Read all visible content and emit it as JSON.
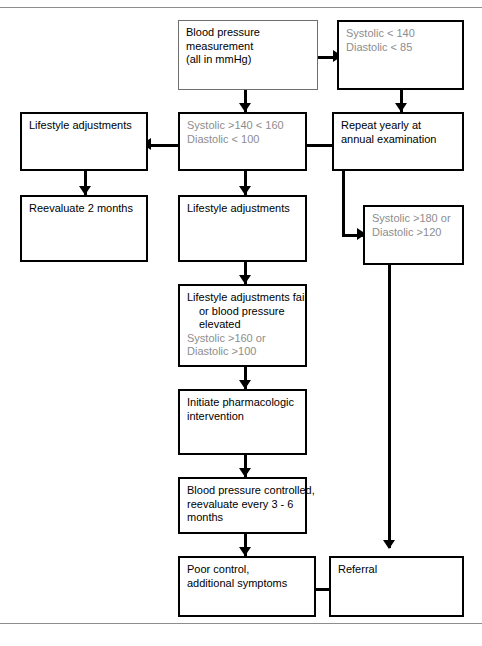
{
  "diagram": {
    "colors": {
      "box_border": "#000000",
      "box_border_light": "#6f6f6f",
      "text": "#000000",
      "text_secondary": "#8d8d8d",
      "background": "#ffffff",
      "page_rule": "#8e8e8e"
    },
    "nodes": [
      {
        "id": "bp-measurement",
        "lines": [
          {
            "text": "Blood pressure",
            "style": "normal"
          },
          {
            "text": "measurement",
            "style": "normal"
          },
          {
            "text": "(all in mmHg)",
            "style": "normal"
          }
        ]
      },
      {
        "id": "normal-range",
        "lines": [
          {
            "text": "Systolic < 140",
            "style": "gray"
          },
          {
            "text": "Diastolic < 85",
            "style": "gray"
          }
        ]
      },
      {
        "id": "stage-one-range",
        "lines": [
          {
            "text": "Systolic >140 < 160",
            "style": "gray"
          },
          {
            "text": "Diastolic < 100",
            "style": "gray"
          }
        ]
      },
      {
        "id": "repeat-yearly",
        "lines": [
          {
            "text": "Repeat yearly at",
            "style": "normal"
          },
          {
            "text": "annual examination",
            "style": "normal"
          }
        ]
      },
      {
        "id": "lifestyle-adjustments-left",
        "lines": [
          {
            "text": "Lifestyle adjustments",
            "style": "normal"
          }
        ]
      },
      {
        "id": "reevaluate-2-months",
        "lines": [
          {
            "text": "Reevaluate 2 months",
            "style": "normal"
          }
        ]
      },
      {
        "id": "lifestyle-adjustments-center",
        "lines": [
          {
            "text": "Lifestyle adjustments",
            "style": "normal"
          }
        ]
      },
      {
        "id": "severe-range",
        "lines": [
          {
            "text": "Systolic >180 or",
            "style": "gray"
          },
          {
            "text": "Diastolic >120",
            "style": "gray"
          }
        ]
      },
      {
        "id": "lifestyle-fail",
        "lines": [
          {
            "text": "Lifestyle adjustments fail",
            "style": "normal"
          },
          {
            "text": "or blood pressure",
            "style": "normal-indent"
          },
          {
            "text": "elevated",
            "style": "normal-indent"
          },
          {
            "text": "Systolic >160 or",
            "style": "gray"
          },
          {
            "text": "Diastolic >100",
            "style": "gray"
          }
        ]
      },
      {
        "id": "initiate-pharmacologic",
        "lines": [
          {
            "text": "Initiate pharmacologic",
            "style": "normal"
          },
          {
            "text": "intervention",
            "style": "normal"
          }
        ]
      },
      {
        "id": "bp-controlled",
        "lines": [
          {
            "text": "Blood pressure controlled,",
            "style": "normal"
          },
          {
            "text": "reevaluate every 3 - 6",
            "style": "normal"
          },
          {
            "text": "months",
            "style": "normal"
          }
        ]
      },
      {
        "id": "poor-control",
        "lines": [
          {
            "text": "Poor control,",
            "style": "normal"
          },
          {
            "text": "additional symptoms",
            "style": "normal"
          }
        ]
      },
      {
        "id": "referral",
        "lines": [
          {
            "text": "Referral",
            "style": "normal"
          }
        ]
      }
    ]
  }
}
